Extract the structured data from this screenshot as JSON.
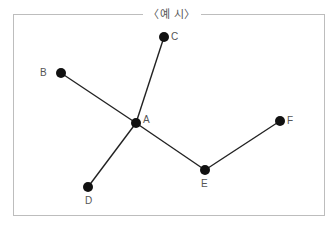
{
  "title": "〈예 시〉",
  "graph": {
    "nodes": [
      {
        "id": "A",
        "label": "A",
        "x": 136,
        "y": 123
      },
      {
        "id": "B",
        "label": "B",
        "x": 61,
        "y": 73
      },
      {
        "id": "C",
        "label": "C",
        "x": 164,
        "y": 37
      },
      {
        "id": "D",
        "label": "D",
        "x": 88,
        "y": 187
      },
      {
        "id": "E",
        "label": "E",
        "x": 205,
        "y": 170
      },
      {
        "id": "F",
        "label": "F",
        "x": 280,
        "y": 121
      }
    ],
    "edges": [
      [
        "A",
        "B"
      ],
      [
        "A",
        "C"
      ],
      [
        "A",
        "D"
      ],
      [
        "A",
        "E"
      ],
      [
        "E",
        "F"
      ]
    ]
  }
}
